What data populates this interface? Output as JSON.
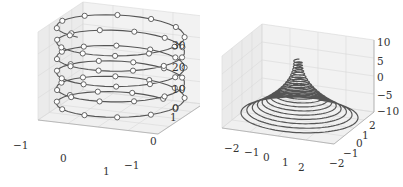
{
  "chart_data": [
    {
      "type": "line3d",
      "title": "",
      "description": "3D helix (circular spiral) with circle markers",
      "series": [
        {
          "name": "helix",
          "marker": "o",
          "marker_face": "#ffffff",
          "color": "#555555",
          "param": "x=cos(t), y=sin(t), z=t",
          "t_range": [
            0,
            34
          ],
          "turns": 5.5
        }
      ],
      "xlim": [
        -1,
        1
      ],
      "ylim": [
        -1,
        1
      ],
      "zlim": [
        0,
        34
      ],
      "x_ticks": [
        "-1",
        "0",
        "1"
      ],
      "y_ticks": [
        "-1",
        "0",
        "1"
      ],
      "z_ticks": [
        "0",
        "10",
        "20",
        "30"
      ],
      "grid": true
    },
    {
      "type": "line3d",
      "title": "",
      "description": "3D conical spiral, radius decreasing as z increases",
      "series": [
        {
          "name": "conical-spiral",
          "color": "#555555",
          "param": "r = z^2/20 + 1 (approx), x=r*sin(theta), y=r*cos(theta)",
          "z_range": [
            -10,
            10
          ],
          "turns": 20
        }
      ],
      "xlim": [
        -2.5,
        2.5
      ],
      "ylim": [
        -2.5,
        2.5
      ],
      "zlim": [
        -10,
        10
      ],
      "x_ticks": [
        "-2",
        "-1",
        "0",
        "1",
        "2"
      ],
      "y_ticks": [
        "-2",
        "-1",
        "0",
        "1",
        "2"
      ],
      "z_ticks": [
        "-10",
        "-5",
        "0",
        "5",
        "10"
      ],
      "grid": true
    }
  ],
  "left": {
    "x_ticks": [
      {
        "label": "−1",
        "x": 13,
        "y": 140
      },
      {
        "label": "0",
        "x": 60,
        "y": 153
      },
      {
        "label": "1",
        "x": 103,
        "y": 166
      }
    ],
    "y_ticks": [
      {
        "label": "−1",
        "x": 124,
        "y": 160
      },
      {
        "label": "0",
        "x": 150,
        "y": 136
      },
      {
        "label": "1",
        "x": 170,
        "y": 112
      }
    ],
    "z_ticks": [
      {
        "label": "0",
        "x": 172,
        "y": 103
      },
      {
        "label": "10",
        "x": 172,
        "y": 84
      },
      {
        "label": "20",
        "x": 172,
        "y": 62
      },
      {
        "label": "30",
        "x": 172,
        "y": 40
      }
    ]
  },
  "right": {
    "x_ticks": [
      {
        "label": "−2",
        "x": 24,
        "y": 143
      },
      {
        "label": "−1",
        "x": 44,
        "y": 147
      },
      {
        "label": "0",
        "x": 63,
        "y": 152
      },
      {
        "label": "1",
        "x": 82,
        "y": 157
      },
      {
        "label": "2",
        "x": 98,
        "y": 162
      }
    ],
    "y_ticks": [
      {
        "label": "−2",
        "x": 129,
        "y": 158
      },
      {
        "label": "−1",
        "x": 143,
        "y": 148
      },
      {
        "label": "0",
        "x": 156,
        "y": 138
      },
      {
        "label": "1",
        "x": 162,
        "y": 130
      },
      {
        "label": "2",
        "x": 169,
        "y": 120
      }
    ],
    "z_ticks": [
      {
        "label": "10",
        "x": 177,
        "y": 37
      },
      {
        "label": "5",
        "x": 177,
        "y": 56
      },
      {
        "label": "0",
        "x": 177,
        "y": 72
      },
      {
        "label": "−5",
        "x": 177,
        "y": 90
      },
      {
        "label": "−10",
        "x": 177,
        "y": 106
      }
    ]
  }
}
